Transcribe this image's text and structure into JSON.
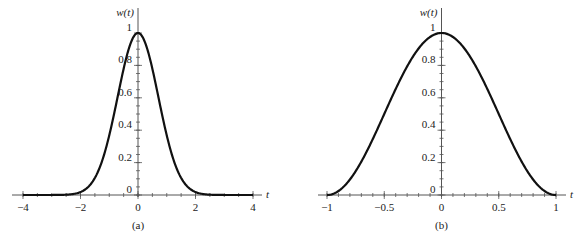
{
  "chart_data": [
    {
      "type": "line",
      "caption": "(a)",
      "xlabel": "t",
      "ylabel": "w(t)",
      "xlim": [
        -4,
        4
      ],
      "ylim": [
        0,
        1
      ],
      "xticks": [
        -4,
        -2,
        0,
        2,
        4
      ],
      "xtick_labels": [
        "−4",
        "−2",
        "0",
        "2",
        "4"
      ],
      "xminor_step": 0.5,
      "yticks": [
        0,
        0.2,
        0.4,
        0.6,
        0.8,
        1
      ],
      "ytick_labels": [
        "0",
        "0.2",
        "0.4",
        "0.6",
        "0.8",
        "1"
      ],
      "yminor_step": 0.05,
      "function": "exp(-t^2)",
      "series": [
        {
          "name": "w(t)",
          "x": [
            -4,
            -3,
            -2.5,
            -2,
            -1.5,
            -1,
            -0.5,
            0,
            0.5,
            1,
            1.5,
            2,
            2.5,
            3,
            4
          ],
          "y": [
            0,
            0.0001,
            0.0019,
            0.0183,
            0.1054,
            0.3679,
            0.7788,
            1,
            0.7788,
            0.3679,
            0.1054,
            0.0183,
            0.0019,
            0.0001,
            0
          ]
        }
      ],
      "grid": false,
      "legend": "none"
    },
    {
      "type": "line",
      "caption": "(b)",
      "xlabel": "t",
      "ylabel": "w(t)",
      "xlim": [
        -1,
        1
      ],
      "ylim": [
        0,
        1
      ],
      "xticks": [
        -1,
        -0.5,
        0,
        0.5,
        1
      ],
      "xtick_labels": [
        "−1",
        "−0.5",
        "0",
        "0.5",
        "1"
      ],
      "xminor_step": 0.1,
      "yticks": [
        0,
        0.2,
        0.4,
        0.6,
        0.8,
        1
      ],
      "ytick_labels": [
        "0",
        "0.2",
        "0.4",
        "0.6",
        "0.8",
        "1"
      ],
      "yminor_step": 0.05,
      "function": "cos^2(pi t / 2)",
      "series": [
        {
          "name": "w(t)",
          "x": [
            -1,
            -0.75,
            -0.5,
            -0.25,
            0,
            0.25,
            0.5,
            0.75,
            1
          ],
          "y": [
            0,
            0.1464,
            0.5,
            0.8536,
            1,
            0.8536,
            0.5,
            0.1464,
            0
          ]
        }
      ],
      "grid": false,
      "legend": "none"
    }
  ]
}
